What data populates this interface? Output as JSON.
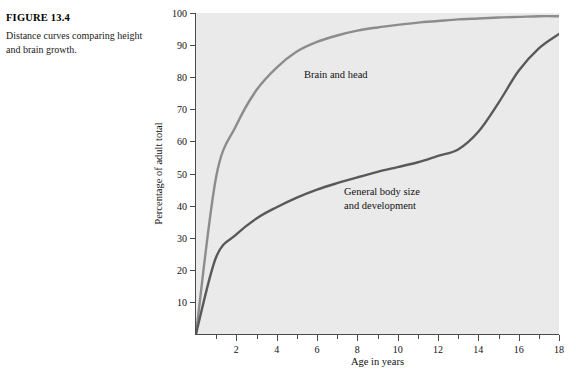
{
  "caption": {
    "figure_label": "FIGURE 13.4",
    "description": "Distance curves comparing height and brain growth."
  },
  "colors": {
    "plot_background": "#eaeaea",
    "page_background": "#ffffff",
    "axis": "#4a4a4a",
    "brain_curve": "#8c8c8c",
    "body_curve": "#595959",
    "text": "#111111"
  },
  "chart_data": {
    "type": "line",
    "title": "",
    "xlabel": "Age in years",
    "ylabel": "Percentage of adult total",
    "xlim": [
      0,
      18
    ],
    "ylim": [
      0,
      100
    ],
    "grid": false,
    "legend_position": "inline-annotation",
    "x_ticks_major": [
      2,
      4,
      6,
      8,
      10,
      12,
      14,
      16,
      18
    ],
    "x_ticks_minor": [
      1,
      3,
      5,
      7,
      9,
      11,
      13,
      15,
      17
    ],
    "y_ticks": [
      10,
      20,
      30,
      40,
      50,
      60,
      70,
      80,
      90,
      100
    ],
    "x": [
      0,
      1,
      2,
      3,
      4,
      5,
      6,
      7,
      8,
      9,
      10,
      11,
      12,
      13,
      14,
      15,
      16,
      17,
      18
    ],
    "series": [
      {
        "name": "Brain and head",
        "color": "#8c8c8c",
        "values": [
          0,
          49,
          65,
          76,
          83,
          88,
          91,
          93,
          94.5,
          95.5,
          96.3,
          97,
          97.5,
          98,
          98.3,
          98.6,
          98.8,
          99,
          99
        ]
      },
      {
        "name": "General body size and development",
        "color": "#595959",
        "values": [
          0,
          24,
          31,
          36,
          39.5,
          42.5,
          45,
          47,
          48.8,
          50.5,
          52,
          53.5,
          55.5,
          57.5,
          63,
          72,
          82,
          89,
          93.5
        ]
      }
    ],
    "annotations": [
      {
        "text": "Brain and head",
        "x": 5.2,
        "y": 78
      },
      {
        "text": "General body size\nand development",
        "x": 7.3,
        "y": 44
      }
    ]
  }
}
